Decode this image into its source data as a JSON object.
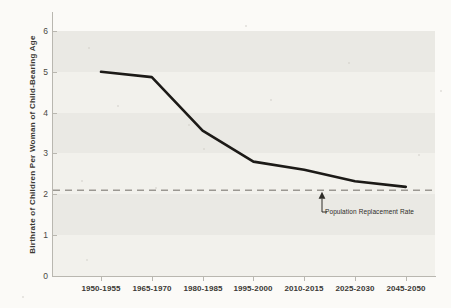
{
  "chart_data": {
    "type": "line",
    "title": "",
    "subtitle": "",
    "xlabel": "",
    "ylabel": "Birthrate of Children Per Woman of Child-Bearing Age",
    "categories": [
      "1950-1955",
      "1965-1970",
      "1980-1985",
      "1995-2000",
      "2010-2015",
      "2025-2030",
      "2045-2050"
    ],
    "values": [
      5.0,
      4.87,
      3.56,
      2.8,
      2.6,
      2.32,
      2.18
    ],
    "series": [
      {
        "name": "Birthrate",
        "values": [
          5.0,
          4.87,
          3.56,
          2.8,
          2.6,
          2.32,
          2.18
        ]
      }
    ],
    "ylim": [
      0,
      6
    ],
    "yticks": [
      0,
      1,
      2,
      3,
      4,
      5,
      6
    ],
    "ytick_labels": [
      "0",
      "1",
      "2",
      "3",
      "4",
      "5",
      "6"
    ],
    "xtick_labels": [
      "1950-1955",
      "1965-1970",
      "1980-1985",
      "1995-2000",
      "2010-2015",
      "2025-2030",
      "2045-2050"
    ],
    "grid": false,
    "banded_background": true,
    "legend": "none",
    "line_color": "#1c1a17",
    "reference_line": {
      "value": 2.1,
      "style": "dashed",
      "color": "#9b9892",
      "label": "Population Replacement Rate"
    },
    "annotations": [
      {
        "text": "Population Replacement Rate",
        "points_to_value": 2.1
      }
    ]
  },
  "axis": {
    "y_title": "Birthrate of Children Per Woman of Child-Bearing Age",
    "y_ticks": [
      "6",
      "5",
      "4",
      "3",
      "2",
      "1",
      "0"
    ],
    "x_ticks": [
      "1950-1955",
      "1965-1970",
      "1980-1985",
      "1995-2000",
      "2010-2015",
      "2025-2030",
      "2045-2050"
    ]
  },
  "annotation": {
    "replacement_rate_label": "Population Replacement Rate"
  },
  "colors": {
    "background": "#fbfaf7",
    "band_dark": "#eae9e4",
    "band_light": "#f2f1ec",
    "line": "#1c1a17",
    "axis": "#b9b7b0",
    "dashed": "#9b9892",
    "text": "#3a3833"
  }
}
